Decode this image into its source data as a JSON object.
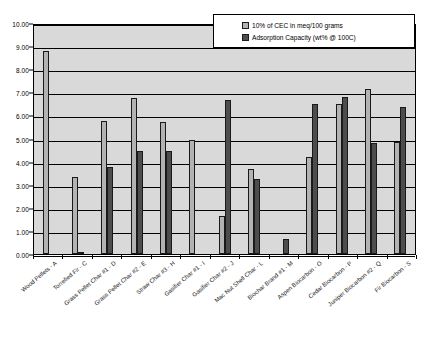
{
  "chart_data": {
    "type": "bar",
    "title": "",
    "xlabel": "",
    "ylabel": "",
    "ylim": [
      0,
      10
    ],
    "ytick_step": 1,
    "ytick_labels": [
      "0.00",
      "1.00",
      "2.00",
      "3.00",
      "4.00",
      "5.00",
      "6.00",
      "7.00",
      "8.00",
      "9.00",
      "10.00"
    ],
    "grid": true,
    "legend_position": "top-right",
    "plot_background": "#d9d9d9",
    "categories": [
      "Wood Pellets - A",
      "Torrefied Fir - C",
      "Grass Pellet Char #1 - D",
      "Grass Pellet Char #2 - E",
      "Straw Char #3 - H",
      "Gasifier Char #1 - I",
      "Gasifier Char #2 - J",
      "Mac Nut Shell Char - L",
      "Biochar Brand #1 - M",
      "Aspen Biocarbon - O",
      "Cedar Biocarbon - P",
      "Juniper Biocarbon #2 - Q",
      "Fir Biocarbon - S"
    ],
    "series": [
      {
        "name": "10% of CEC in meq/100 grams",
        "color": "#b3b3b3",
        "values": [
          8.8,
          3.35,
          5.75,
          6.75,
          5.7,
          4.95,
          1.65,
          3.7,
          0.0,
          4.2,
          6.5,
          7.15,
          4.85
        ]
      },
      {
        "name": "Adsorption Capacity (wt% @ 100C)",
        "color": "#4d4d4d",
        "values": [
          0.0,
          0.1,
          3.75,
          4.45,
          4.45,
          0.0,
          6.65,
          3.25,
          0.65,
          6.5,
          6.8,
          4.8,
          6.35
        ]
      }
    ]
  },
  "legend": {
    "items": [
      {
        "label": "10% of CEC in meq/100 grams"
      },
      {
        "label": "Adsorption Capacity (wt% @ 100C)"
      }
    ]
  }
}
